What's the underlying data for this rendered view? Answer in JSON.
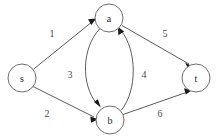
{
  "diagram": {
    "colors": {
      "background": "#ffffff",
      "node_stroke": "#6e6e6e",
      "node_fill": "#ffffff",
      "edge_stroke": "#5c5c5c",
      "arrow_fill": "#1a1a1a",
      "label_text": "#2b2b2b"
    },
    "nodes": [
      {
        "id": "s",
        "label": "s",
        "cx": 22,
        "cy": 78,
        "r": 14
      },
      {
        "id": "a",
        "label": "a",
        "cx": 109,
        "cy": 18,
        "r": 14
      },
      {
        "id": "b",
        "label": "b",
        "cx": 110,
        "cy": 120,
        "r": 14
      },
      {
        "id": "t",
        "label": "t",
        "cx": 196,
        "cy": 78,
        "r": 14
      }
    ],
    "edges": [
      {
        "id": "s-a",
        "from": "s",
        "to": "a",
        "label": "1",
        "label_x": 52,
        "label_y": 33,
        "shape": "straight"
      },
      {
        "id": "s-b",
        "from": "s",
        "to": "b",
        "label": "2",
        "label_x": 47,
        "label_y": 113,
        "shape": "straight"
      },
      {
        "id": "a-b",
        "from": "a",
        "to": "b",
        "label": "3",
        "label_x": 70,
        "label_y": 74,
        "shape": "curve-left"
      },
      {
        "id": "b-a",
        "from": "b",
        "to": "a",
        "label": "4",
        "label_x": 144,
        "label_y": 74,
        "shape": "curve-right"
      },
      {
        "id": "a-t",
        "from": "a",
        "to": "t",
        "label": "5",
        "label_x": 165,
        "label_y": 33,
        "shape": "straight"
      },
      {
        "id": "b-t",
        "from": "b",
        "to": "t",
        "label": "6",
        "label_x": 160,
        "label_y": 113,
        "shape": "straight"
      }
    ]
  }
}
